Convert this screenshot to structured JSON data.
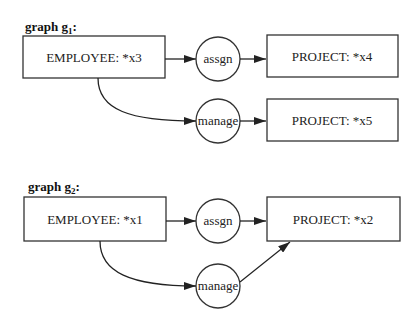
{
  "graphs": [
    {
      "title": "graph g",
      "subscript": "1",
      "title_suffix": ":",
      "nodes": {
        "employee": "EMPLOYEE: *x3",
        "assgn": "assgn",
        "manage": "manage",
        "project_a": "PROJECT: *x4",
        "project_b": "PROJECT: *x5"
      }
    },
    {
      "title": "graph g",
      "subscript": "2",
      "title_suffix": ":",
      "nodes": {
        "employee": "EMPLOYEE: *x1",
        "assgn": "assgn",
        "manage": "manage",
        "project_a": "PROJECT: *x2"
      }
    }
  ],
  "colors": {
    "stroke": "#333333",
    "text": "#222222",
    "background": "#ffffff"
  }
}
